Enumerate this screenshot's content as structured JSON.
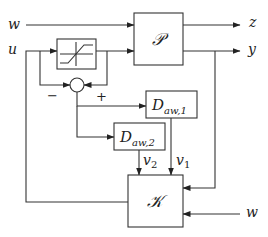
{
  "diagram": {
    "blocks": {
      "plant": {
        "label": "𝒫"
      },
      "controller": {
        "label": "𝒦"
      },
      "daw1": {
        "base": "D",
        "sub": "aw,1"
      },
      "daw2": {
        "base": "D",
        "sub": "aw,2"
      },
      "saturation": {
        "label": "sat"
      }
    },
    "signals": {
      "w_in": "w",
      "u_in": "u",
      "z_out": "z",
      "y_out": "y",
      "w_ctrl": "w",
      "v1": "v",
      "v1_sub": "1",
      "v2": "v",
      "v2_sub": "2"
    },
    "summing_junction": {
      "minus": "−",
      "plus": "+"
    }
  }
}
